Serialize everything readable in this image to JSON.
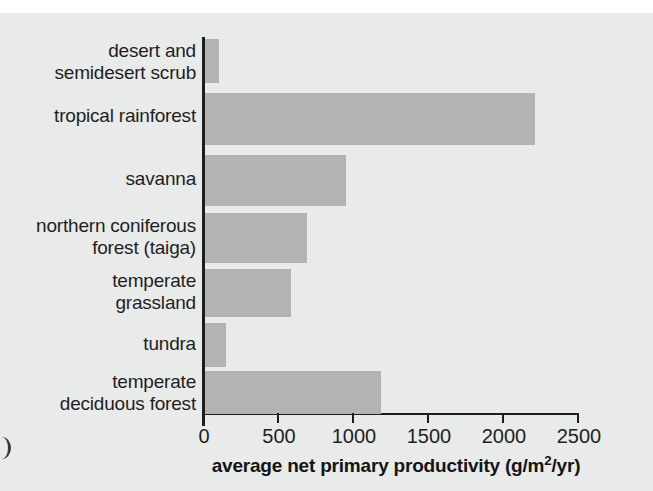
{
  "chart_data": {
    "type": "bar",
    "orientation": "horizontal",
    "title": "",
    "xlabel": "average net primary productivity (g/m²/yr)",
    "ylabel": "",
    "categories": [
      "desert and semidesert scrub",
      "tropical rainforest",
      "savanna",
      "northern coniferous forest (taiga)",
      "temperate grassland",
      "tundra",
      "temperate deciduous forest"
    ],
    "values": [
      90,
      2200,
      940,
      680,
      570,
      140,
      1170
    ],
    "xlim": [
      0,
      2500
    ],
    "xticks": [
      0,
      500,
      1000,
      1500,
      2000,
      2500
    ],
    "xtick_labels": [
      "0",
      "500",
      "1000",
      "1500",
      "2000",
      "2500"
    ],
    "grid": false,
    "legend": "none",
    "bar_color": "#b3b3b3",
    "axis_color": "#1d1d1d",
    "background_color": "#e9eaea"
  },
  "axis": {
    "x_title_main": "average net primary productivity (g/m",
    "x_title_sup": "2",
    "x_title_tail": "/yr)"
  },
  "rows": [
    {
      "label_line1": "desert and",
      "label_line2": "semidesert scrub",
      "value": 90
    },
    {
      "label_line1": "tropical rainforest",
      "label_line2": "",
      "value": 2200
    },
    {
      "label_line1": "savanna",
      "label_line2": "",
      "value": 940
    },
    {
      "label_line1": "northern coniferous",
      "label_line2": "forest (taiga)",
      "value": 680
    },
    {
      "label_line1": "temperate",
      "label_line2": "grassland",
      "value": 570
    },
    {
      "label_line1": "tundra",
      "label_line2": "",
      "value": 140
    },
    {
      "label_line1": "temperate",
      "label_line2": "deciduous forest",
      "value": 1170
    }
  ],
  "ticks": [
    {
      "label": "0"
    },
    {
      "label": "500"
    },
    {
      "label": "1000"
    },
    {
      "label": "1500"
    },
    {
      "label": "2000"
    },
    {
      "label": "2500"
    }
  ],
  "edge_artifact": ")"
}
